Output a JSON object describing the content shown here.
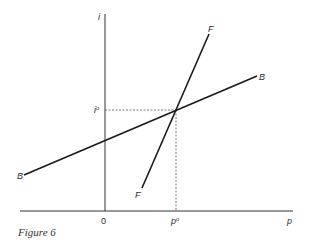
{
  "figure": {
    "caption": "Figure 6",
    "axes": {
      "y_label": "i",
      "x_label": "p",
      "origin_label": "0"
    },
    "equilibrium": {
      "i_label": "i",
      "i_sup": "o",
      "p_label": "p",
      "p_sup": "o"
    },
    "curves": [
      {
        "name": "F",
        "label_top": "F",
        "label_bottom": "F"
      },
      {
        "name": "B",
        "label_left": "B",
        "label_right": "B"
      }
    ],
    "colors": {
      "line": "#1a1a1a",
      "axis": "#333333",
      "dashed": "#555555"
    }
  }
}
